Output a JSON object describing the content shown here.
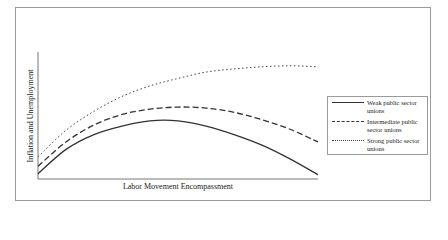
{
  "chart_data": {
    "type": "line",
    "title": "",
    "xlabel": "Labor Movement Encompassment",
    "ylabel": "Inflation and Unemployment",
    "grid": false,
    "legend_position": "right",
    "x": [
      0,
      0.1,
      0.2,
      0.3,
      0.4,
      0.5,
      0.6,
      0.7,
      0.8,
      0.9,
      1.0
    ],
    "series": [
      {
        "name": "Weak public sector unions",
        "style": "solid",
        "values": [
          0.05,
          0.28,
          0.42,
          0.5,
          0.55,
          0.55,
          0.5,
          0.42,
          0.32,
          0.19,
          0.04
        ]
      },
      {
        "name": "Intermediate public sector unions",
        "style": "dashed",
        "values": [
          0.12,
          0.35,
          0.51,
          0.61,
          0.66,
          0.68,
          0.67,
          0.63,
          0.56,
          0.47,
          0.35
        ]
      },
      {
        "name": "Strong public sector unions",
        "style": "dotted",
        "values": [
          0.21,
          0.46,
          0.64,
          0.78,
          0.88,
          0.95,
          1.01,
          1.04,
          1.06,
          1.07,
          1.06
        ]
      }
    ],
    "ylim": [
      0,
      1.2
    ],
    "axis_ticks": "none"
  },
  "legend": {
    "items": [
      {
        "label": "Weak public sector unions",
        "style": "solid"
      },
      {
        "label": "Intermediate public sector unions",
        "style": "dashed"
      },
      {
        "label": "Strong public sector unions",
        "style": "dotted"
      }
    ]
  }
}
